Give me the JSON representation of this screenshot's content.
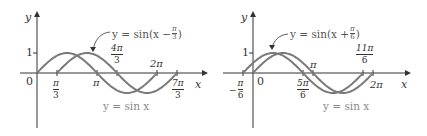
{
  "chart_data": [
    {
      "type": "line",
      "title": "",
      "xlabel": "x",
      "ylabel": "y",
      "ylim": [
        -1,
        1
      ],
      "xlim": [
        0,
        2.333
      ],
      "x_unit": "pi",
      "series": [
        {
          "name": "y = sin x",
          "function": "sin(x)",
          "domain_pi": [
            0,
            2
          ]
        },
        {
          "name": "y = sin(x − π/3)",
          "function": "sin(x - pi/3)",
          "domain_pi": [
            0.3333,
            2.3333
          ]
        }
      ],
      "x_ticks": [
        "π/3",
        "π",
        "4π/3",
        "2π",
        "7π/3"
      ],
      "y_ticks": [
        "1"
      ],
      "origin_label": "0",
      "grid": false,
      "annotations": [
        "y = sin(x − π/3)",
        "y = sin x"
      ]
    },
    {
      "type": "line",
      "title": "",
      "xlabel": "x",
      "ylabel": "y",
      "ylim": [
        -1,
        1
      ],
      "xlim": [
        -0.1667,
        2
      ],
      "x_unit": "pi",
      "series": [
        {
          "name": "y = sin x",
          "function": "sin(x)",
          "domain_pi": [
            0,
            2
          ]
        },
        {
          "name": "y = sin(x + π/6)",
          "function": "sin(x + pi/6)",
          "domain_pi": [
            -0.1667,
            1.8333
          ]
        }
      ],
      "x_ticks": [
        "−π/6",
        "5π/6",
        "π",
        "11π/6",
        "2π"
      ],
      "y_ticks": [
        "1"
      ],
      "origin_label": "0",
      "grid": false,
      "annotations": [
        "y = sin(x + π/6)",
        "y = sin x"
      ]
    }
  ],
  "left": {
    "y_axis": "y",
    "x_axis": "x",
    "origin": "0",
    "one": "1",
    "shifted_label": "y = sin(x − ",
    "shifted_num": "π",
    "shifted_den": "3",
    "base_label": "y = sin x",
    "t_pi3_num": "π",
    "t_pi3_den": "3",
    "t_pi": "π",
    "t_4pi3_num": "4π",
    "t_4pi3_den": "3",
    "t_2pi": "2π",
    "t_7pi3_num": "7π",
    "t_7pi3_den": "3"
  },
  "right": {
    "y_axis": "y",
    "x_axis": "x",
    "origin": "0",
    "one": "1",
    "shifted_label": "y = sin(x + ",
    "shifted_num": "π",
    "shifted_den": "6",
    "base_label": "y = sin x",
    "t_mpi6_num": "π",
    "t_mpi6_den": "6",
    "t_minus": "−",
    "t_5pi6_num": "5π",
    "t_5pi6_den": "6",
    "t_pi": "π",
    "t_11pi6_num": "11π",
    "t_11pi6_den": "6",
    "t_2pi": "2π"
  },
  "colors": {
    "curve": "#7a7a7a",
    "axis": "#333333",
    "text": "#333333"
  }
}
